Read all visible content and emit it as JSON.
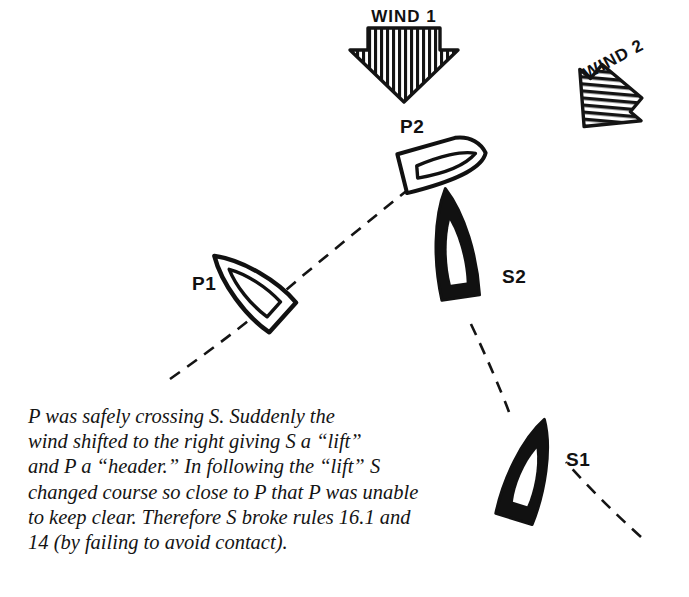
{
  "figure": {
    "kind": "sailing-racing-rules-diagram",
    "background_color": "#ffffff",
    "ink_color": "#111111"
  },
  "wind": {
    "arrows": [
      {
        "id": "wind-1",
        "label": "WIND 1",
        "label_clipped_at_top": true,
        "direction": "down",
        "rotation_deg": 0,
        "fill_style": "hatched",
        "position": {
          "x": 404,
          "y": 44
        }
      },
      {
        "id": "wind-2",
        "label": "WIND 2",
        "label_clipped_at_top": false,
        "direction": "down-left",
        "rotation_deg": 40,
        "fill_style": "hatched",
        "position": {
          "x": 613,
          "y": 92
        }
      }
    ]
  },
  "boats": [
    {
      "id": "P1",
      "label": "P1",
      "hull": "white",
      "heading_deg": 42,
      "position": {
        "x": 250,
        "y": 288
      },
      "label_position": {
        "x": 192,
        "y": 285
      }
    },
    {
      "id": "P2",
      "label": "P2",
      "hull": "white",
      "heading_deg": 72,
      "position": {
        "x": 441,
        "y": 164
      },
      "label_position": {
        "x": 400,
        "y": 128
      }
    },
    {
      "id": "S1",
      "label": "S1",
      "hull": "black",
      "heading_deg": -17,
      "position": {
        "x": 528,
        "y": 473
      },
      "label_position": {
        "x": 568,
        "y": 461
      }
    },
    {
      "id": "S2",
      "label": "S2",
      "hull": "black",
      "heading_deg": -8,
      "position": {
        "x": 454,
        "y": 250
      },
      "label_position": {
        "x": 502,
        "y": 283
      }
    }
  ],
  "tracks": [
    {
      "id": "p-track",
      "style": "dashed",
      "description": "P's curved track from lower left through P1 up to P2"
    },
    {
      "id": "s-track",
      "style": "dashed",
      "description": "S's curved track from lower right through S1 up to S2"
    }
  ],
  "caption": {
    "lines": [
      "P was safely crossing S. Suddenly the",
      "wind shifted to the right giving S a “lift”",
      "and P a “header.” In following the “lift” S",
      "changed course so close to P that P was unable",
      "to keep clear. Therefore S broke rules 16.1 and",
      "14 (by failing to avoid contact)."
    ]
  }
}
